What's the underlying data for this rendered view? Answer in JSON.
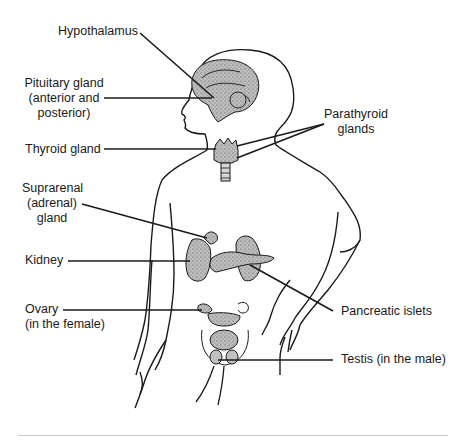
{
  "figure": {
    "labels": {
      "hypothalamus": "Hypothalamus",
      "pituitary": {
        "line1": "Pituitary gland",
        "line2": "(anterior and",
        "line3": "posterior)"
      },
      "thyroid": "Thyroid gland",
      "parathyroid": {
        "line1": "Parathyroid",
        "line2": "glands"
      },
      "suprarenal": {
        "line1": "Suprarenal",
        "line2": "(adrenal)",
        "line3": "gland"
      },
      "kidney": "Kidney",
      "pancreatic": "Pancreatic islets",
      "ovary": {
        "line1": "Ovary",
        "line2": "(in the female)"
      },
      "testis": "Testis (in the male)"
    },
    "colors": {
      "ink": "#1a1a1a",
      "organ_fill": "#b8b8b8",
      "divider": "#c8c8c8"
    }
  }
}
